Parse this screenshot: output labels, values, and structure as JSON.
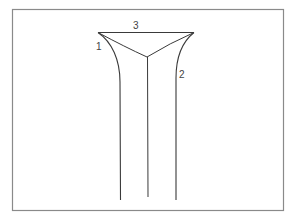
{
  "diagram": {
    "labels": {
      "one": "1",
      "two": "2",
      "three": "3"
    },
    "colors": {
      "stroke": "#3a3a3a",
      "frame": "#8a8a8a",
      "background": "#ffffff"
    }
  }
}
